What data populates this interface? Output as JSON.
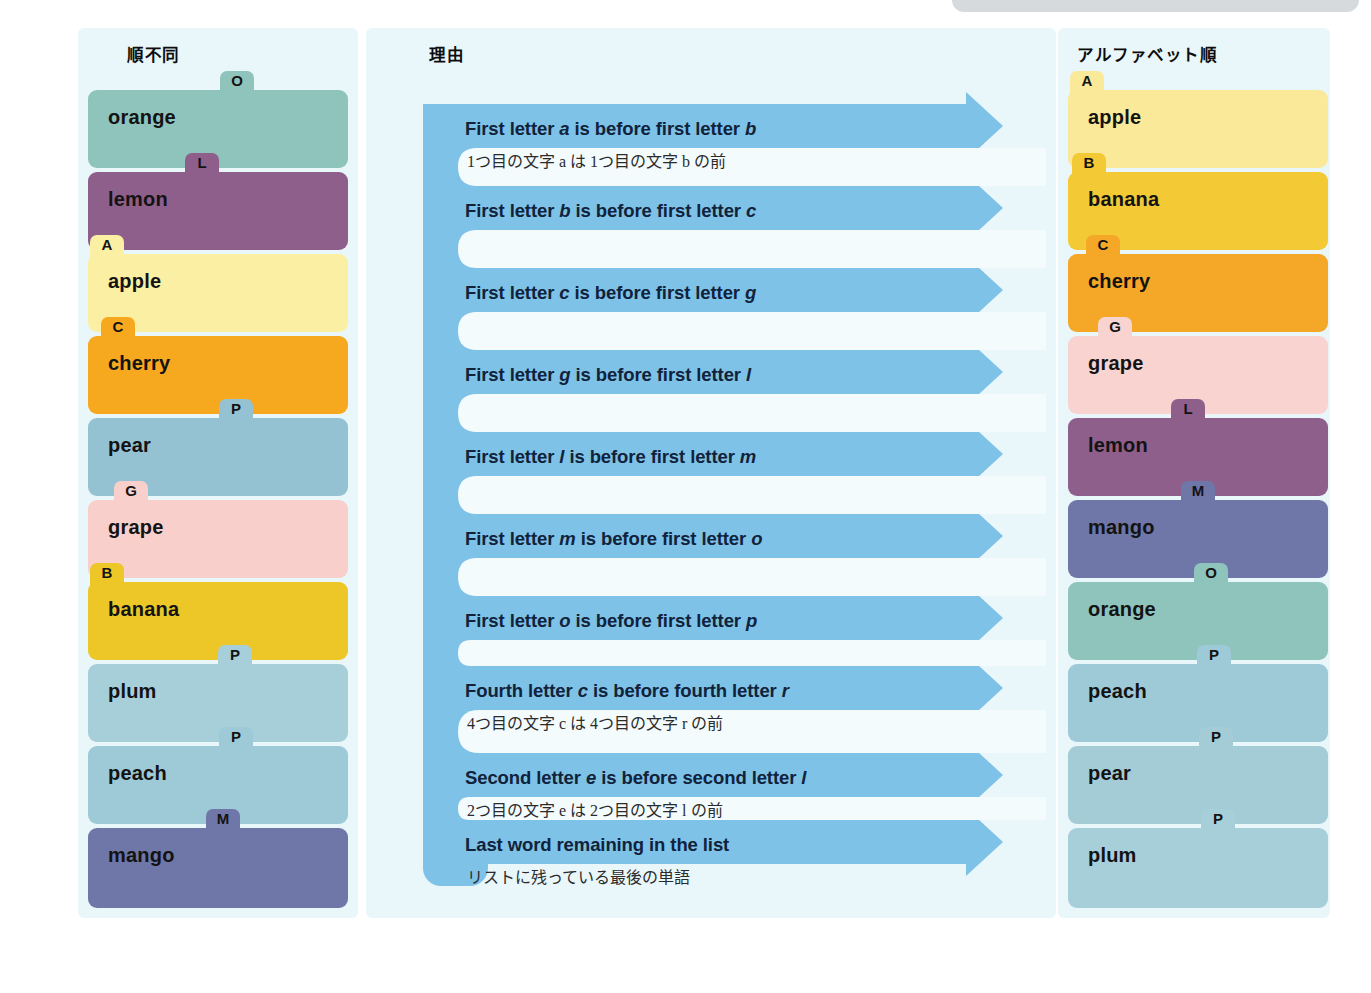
{
  "page": {
    "background": "#ffffff",
    "panel_bg": "#e9f6fa",
    "arrow_blue": "#7fc2e8",
    "notch_white": "#f3fbfd",
    "grey_pill": "#d7dadd"
  },
  "columns": {
    "left": {
      "title": "順不同"
    },
    "middle": {
      "title": "理由"
    },
    "right": {
      "title": "アルファベット順"
    }
  },
  "unsorted_list": {
    "items": [
      {
        "word": "orange",
        "tab": "O",
        "color": "#8fc4bd",
        "tab_color": "#8fc4bd",
        "tab_left": 132,
        "height": 78
      },
      {
        "word": "lemon",
        "tab": "L",
        "color": "#8f5f8c",
        "tab_color": "#8f5f8c",
        "tab_left": 97,
        "height": 78
      },
      {
        "word": "apple",
        "tab": "A",
        "color": "#fbefa3",
        "tab_color": "#fbefa3",
        "tab_left": 2,
        "height": 78
      },
      {
        "word": "cherry",
        "tab": "C",
        "color": "#f6a81f",
        "tab_color": "#f6a81f",
        "tab_left": 13,
        "height": 78
      },
      {
        "word": "pear",
        "tab": "P",
        "color": "#94c2d2",
        "tab_color": "#94c2d2",
        "tab_left": 131,
        "height": 78
      },
      {
        "word": "grape",
        "tab": "G",
        "color": "#f8cfcb",
        "tab_color": "#f8cfcb",
        "tab_left": 26,
        "height": 78
      },
      {
        "word": "banana",
        "tab": "B",
        "color": "#edc728",
        "tab_color": "#edc728",
        "tab_left": 2,
        "height": 78
      },
      {
        "word": "plum",
        "tab": "P",
        "color": "#a6cfda",
        "tab_color": "#a6cfda",
        "tab_left": 130,
        "height": 78
      },
      {
        "word": "peach",
        "tab": "P",
        "color": "#9dcad6",
        "tab_color": "#9dcad6",
        "tab_left": 131,
        "height": 78
      },
      {
        "word": "mango",
        "tab": "M",
        "color": "#6f76a8",
        "tab_color": "#6f76a8",
        "tab_left": 118,
        "height": 80
      }
    ]
  },
  "sorted_list": {
    "items": [
      {
        "word": "apple",
        "tab": "A",
        "color": "#fbe99a",
        "tab_color": "#fbe99a",
        "tab_left": 2,
        "height": 78
      },
      {
        "word": "banana",
        "tab": "B",
        "color": "#f3ca36",
        "tab_color": "#f3ca36",
        "tab_left": 4,
        "height": 78
      },
      {
        "word": "cherry",
        "tab": "C",
        "color": "#f5a827",
        "tab_color": "#f5a827",
        "tab_left": 18,
        "height": 78
      },
      {
        "word": "grape",
        "tab": "G",
        "color": "#f9d3d0",
        "tab_color": "#f9d3d0",
        "tab_left": 30,
        "height": 78
      },
      {
        "word": "lemon",
        "tab": "L",
        "color": "#8f5f8c",
        "tab_color": "#8f5f8c",
        "tab_left": 103,
        "height": 78
      },
      {
        "word": "mango",
        "tab": "M",
        "color": "#6f76a8",
        "tab_color": "#6f76a8",
        "tab_left": 113,
        "height": 78
      },
      {
        "word": "orange",
        "tab": "O",
        "color": "#8fc4bd",
        "tab_color": "#8fc4bd",
        "tab_left": 126,
        "height": 78
      },
      {
        "word": "peach",
        "tab": "P",
        "color": "#9dcad6",
        "tab_color": "#9dcad6",
        "tab_left": 129,
        "height": 78
      },
      {
        "word": "pear",
        "tab": "P",
        "color": "#a3ccd6",
        "tab_color": "#a3ccd6",
        "tab_left": 131,
        "height": 78
      },
      {
        "word": "plum",
        "tab": "P",
        "color": "#a6cfda",
        "tab_color": "#a6cfda",
        "tab_left": 133,
        "height": 80
      }
    ]
  },
  "reasons": [
    {
      "en_pre": "First letter ",
      "en_a": "a",
      "en_mid": " is before first letter ",
      "en_b": "b",
      "jp": "1つ目の文字 a は 1つ目の文字 b の前",
      "top": 90
    },
    {
      "en_pre": "First letter ",
      "en_a": "b",
      "en_mid": " is before first letter ",
      "en_b": "c",
      "jp": "",
      "top": 172
    },
    {
      "en_pre": "First letter ",
      "en_a": "c",
      "en_mid": " is before first letter ",
      "en_b": "g",
      "jp": "",
      "top": 254
    },
    {
      "en_pre": "First letter ",
      "en_a": "g",
      "en_mid": " is before first letter ",
      "en_b": "l",
      "jp": "",
      "top": 336
    },
    {
      "en_pre": "First letter ",
      "en_a": "l",
      "en_mid": " is before first letter ",
      "en_b": "m",
      "jp": "",
      "top": 418
    },
    {
      "en_pre": "First letter ",
      "en_a": "m",
      "en_mid": " is before first letter ",
      "en_b": "o",
      "jp": "",
      "top": 500
    },
    {
      "en_pre": "First letter ",
      "en_a": "o",
      "en_mid": " is before first letter ",
      "en_b": "p",
      "jp": "",
      "top": 582
    },
    {
      "en_pre": "Fourth letter ",
      "en_a": "c",
      "en_mid": " is before fourth letter ",
      "en_b": "r",
      "jp": "4つ目の文字 c は 4つ目の文字 r の前",
      "top": 652
    },
    {
      "en_pre": "Second letter ",
      "en_a": "e",
      "en_mid": " is before second letter ",
      "en_b": "l",
      "jp": "2つ目の文字 e は 2つ目の文字 l の前",
      "top": 739
    },
    {
      "en_pre": "Last word remaining in the list",
      "en_a": "",
      "en_mid": "",
      "en_b": "",
      "jp": "リストに残っている最後の単語",
      "top": 806
    }
  ]
}
